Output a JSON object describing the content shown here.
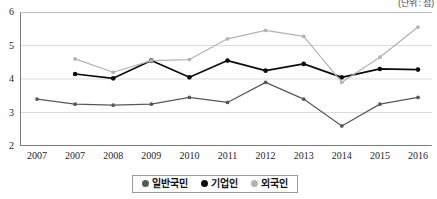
{
  "unit_note": "(단위 : 점)",
  "chart_data": {
    "type": "line",
    "title": "",
    "subtitle": "",
    "xlabel": "",
    "ylabel": "",
    "unit": "점",
    "unit_note": "(단위 : 점)",
    "categories": [
      "2007",
      "2007",
      "2008",
      "2009",
      "2010",
      "2011",
      "2012",
      "2013",
      "2014",
      "2015",
      "2016"
    ],
    "ylim": [
      2,
      6
    ],
    "yticks": [
      2,
      3,
      4,
      5,
      6
    ],
    "grid": true,
    "legend_position": "bottom",
    "series": [
      {
        "name": "일반국민",
        "color": "#595959",
        "marker": "circle",
        "values": [
          3.4,
          3.25,
          3.22,
          3.25,
          3.45,
          3.3,
          3.9,
          3.4,
          2.6,
          3.25,
          3.45
        ]
      },
      {
        "name": "기업인",
        "color": "#0d0d0d",
        "marker": "circle",
        "values": [
          null,
          4.15,
          4.02,
          4.55,
          4.05,
          4.55,
          4.25,
          4.45,
          4.05,
          4.3,
          4.28
        ]
      },
      {
        "name": "외국인",
        "color": "#b3b3b3",
        "marker": "circle",
        "values": [
          null,
          4.6,
          4.2,
          4.55,
          4.58,
          5.2,
          5.45,
          5.27,
          3.9,
          4.65,
          5.55
        ]
      }
    ]
  }
}
